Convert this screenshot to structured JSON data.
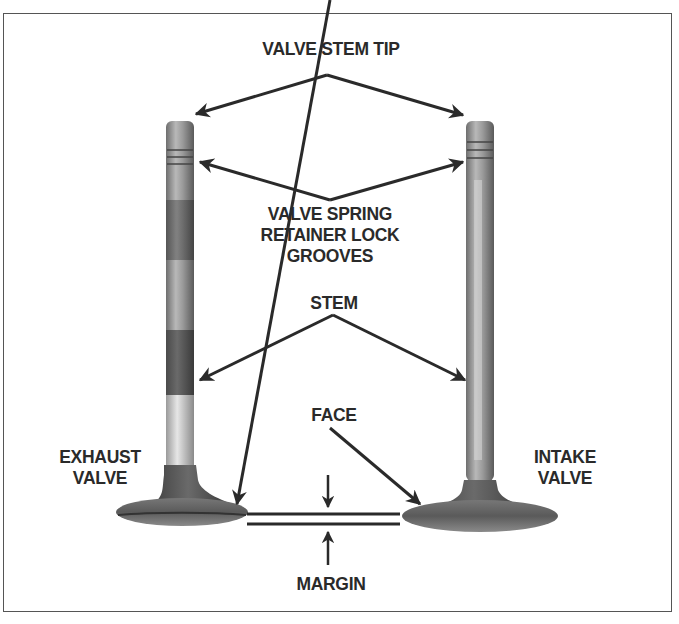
{
  "diagram": {
    "labels": {
      "valve_stem_tip": "VALVE STEM TIP",
      "retainer_line1": "VALVE SPRING",
      "retainer_line2": "RETAINER LOCK",
      "retainer_line3": "GROOVES",
      "stem": "STEM",
      "face": "FACE",
      "exhaust_line1": "EXHAUST",
      "exhaust_line2": "VALVE",
      "intake_line1": "INTAKE",
      "intake_line2": "VALVE",
      "margin": "MARGIN"
    },
    "components": [
      "exhaust valve",
      "intake valve"
    ],
    "colors": {
      "text": "#2a2a2a",
      "arrow": "#2a2a2a",
      "frame": "#555555",
      "valve_metal": "#8a8a8a"
    }
  }
}
